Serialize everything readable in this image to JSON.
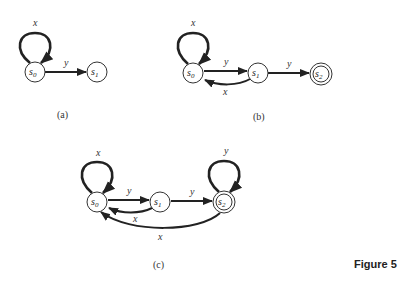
{
  "figure_label": "Figure 5",
  "diagrams": [
    {
      "caption": "(a)",
      "states": [
        {
          "name": "s",
          "sub": "0",
          "accepting": false
        },
        {
          "name": "s",
          "sub": "1",
          "accepting": false
        }
      ],
      "transitions": [
        {
          "from": "s0",
          "to": "s0",
          "label": "x"
        },
        {
          "from": "s0",
          "to": "s1",
          "label": "y"
        }
      ]
    },
    {
      "caption": "(b)",
      "states": [
        {
          "name": "s",
          "sub": "0",
          "accepting": false
        },
        {
          "name": "s",
          "sub": "1",
          "accepting": false
        },
        {
          "name": "s",
          "sub": "2",
          "accepting": true
        }
      ],
      "transitions": [
        {
          "from": "s0",
          "to": "s0",
          "label": "x"
        },
        {
          "from": "s0",
          "to": "s1",
          "label": "y"
        },
        {
          "from": "s1",
          "to": "s0",
          "label": "x"
        },
        {
          "from": "s1",
          "to": "s2",
          "label": "y"
        }
      ]
    },
    {
      "caption": "(c)",
      "states": [
        {
          "name": "s",
          "sub": "0",
          "accepting": false
        },
        {
          "name": "s",
          "sub": "1",
          "accepting": false
        },
        {
          "name": "s",
          "sub": "2",
          "accepting": true
        }
      ],
      "transitions": [
        {
          "from": "s0",
          "to": "s0",
          "label": "x"
        },
        {
          "from": "s0",
          "to": "s1",
          "label": "y"
        },
        {
          "from": "s1",
          "to": "s0",
          "label": "x"
        },
        {
          "from": "s1",
          "to": "s2",
          "label": "y"
        },
        {
          "from": "s2",
          "to": "s2",
          "label": "y"
        },
        {
          "from": "s2",
          "to": "s0",
          "label": "x"
        }
      ]
    }
  ]
}
